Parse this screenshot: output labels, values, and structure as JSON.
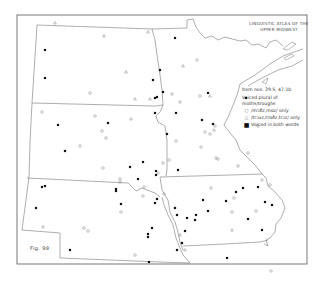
{
  "map": {
    "title_line1": "LINGUISTIC ATLAS OF THE",
    "title_line2": "UPPER MIDWEST",
    "figure_label": "Fig. 99",
    "colors": {
      "border": "#555555",
      "state_lines": "#777777",
      "open_marker": "#888888",
      "filled_marker": "#111111",
      "background": "#ffffff"
    }
  },
  "legend": {
    "item_numbers": "Item nos. 29.5, 47.1b",
    "heading_line1": "Voiced plural of",
    "heading_line2": "moths/troughs",
    "entries": [
      {
        "symbol": "open-circle",
        "glyph": "○",
        "label": "/mɔðz,mɑz/ only"
      },
      {
        "symbol": "open-triangle",
        "glyph": "△",
        "label": "/trɔvz,trɑðz,trɔz/ only"
      },
      {
        "symbol": "filled-square",
        "glyph": "■",
        "label": "Voiced in both words"
      }
    ]
  },
  "markers": {
    "filled": [
      [
        45,
        50
      ],
      [
        45,
        78
      ],
      [
        153,
        80
      ],
      [
        157,
        97
      ],
      [
        155,
        98
      ],
      [
        58,
        125
      ],
      [
        155,
        113
      ],
      [
        108,
        123
      ],
      [
        65,
        151
      ],
      [
        143,
        162
      ],
      [
        130,
        167
      ],
      [
        156,
        171
      ],
      [
        156,
        175
      ],
      [
        42,
        187
      ],
      [
        45,
        186
      ],
      [
        116,
        191
      ],
      [
        116,
        189
      ],
      [
        157,
        199
      ],
      [
        155,
        203
      ],
      [
        36,
        208
      ],
      [
        121,
        204
      ],
      [
        138,
        179
      ],
      [
        175,
        38
      ],
      [
        160,
        70
      ],
      [
        163,
        92
      ],
      [
        208,
        93
      ],
      [
        202,
        120
      ],
      [
        213,
        124
      ],
      [
        246,
        98
      ],
      [
        176,
        113
      ],
      [
        167,
        134
      ],
      [
        175,
        208
      ],
      [
        177,
        215
      ],
      [
        196,
        215
      ],
      [
        152,
        228
      ],
      [
        203,
        200
      ],
      [
        148,
        237
      ],
      [
        187,
        218
      ],
      [
        185,
        231
      ],
      [
        182,
        243
      ],
      [
        236,
        192
      ],
      [
        243,
        188
      ],
      [
        226,
        201
      ],
      [
        258,
        187
      ],
      [
        272,
        205
      ],
      [
        265,
        202
      ],
      [
        262,
        230
      ],
      [
        248,
        219
      ],
      [
        227,
        258
      ],
      [
        148,
        234
      ],
      [
        149,
        262
      ],
      [
        177,
        250
      ],
      [
        70,
        250
      ],
      [
        178,
        170
      ],
      [
        208,
        211
      ],
      [
        195,
        220
      ]
    ],
    "open_circle": [
      [
        42,
        112
      ],
      [
        95,
        116
      ],
      [
        106,
        138
      ],
      [
        80,
        146
      ],
      [
        103,
        168
      ],
      [
        120,
        182
      ],
      [
        144,
        187
      ],
      [
        143,
        196
      ],
      [
        102,
        131
      ],
      [
        43,
        227
      ],
      [
        88,
        231
      ],
      [
        135,
        255
      ],
      [
        90,
        93
      ],
      [
        172,
        94
      ],
      [
        180,
        102
      ],
      [
        120,
        179
      ],
      [
        121,
        212
      ],
      [
        84,
        228
      ],
      [
        164,
        194
      ],
      [
        169,
        160
      ],
      [
        158,
        173
      ],
      [
        197,
        60
      ],
      [
        200,
        96
      ],
      [
        205,
        132
      ],
      [
        210,
        134
      ],
      [
        215,
        126
      ],
      [
        176,
        141
      ],
      [
        201,
        147
      ],
      [
        238,
        166
      ],
      [
        258,
        126
      ],
      [
        248,
        153
      ],
      [
        234,
        198
      ],
      [
        232,
        212
      ],
      [
        256,
        211
      ],
      [
        218,
        159
      ],
      [
        216,
        158
      ],
      [
        163,
        163
      ],
      [
        262,
        180
      ],
      [
        270,
        185
      ],
      [
        211,
        188
      ],
      [
        271,
        271
      ]
    ],
    "open_triangle": [
      [
        55,
        23
      ],
      [
        104,
        36
      ],
      [
        148,
        32
      ],
      [
        126,
        72
      ],
      [
        135,
        99
      ],
      [
        131,
        119
      ],
      [
        150,
        99
      ],
      [
        183,
        66
      ],
      [
        210,
        96
      ],
      [
        214,
        130
      ],
      [
        232,
        230
      ],
      [
        180,
        235
      ],
      [
        185,
        250
      ]
    ]
  }
}
